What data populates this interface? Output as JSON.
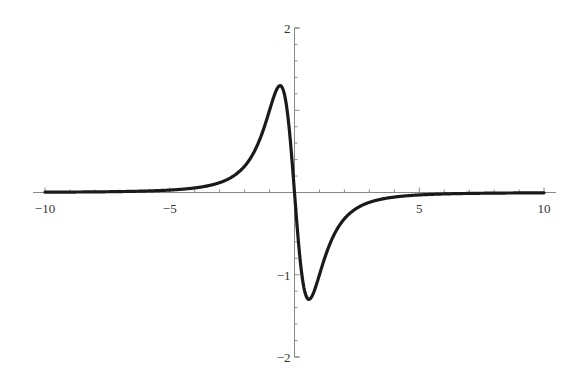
{
  "chart_data": {
    "type": "line",
    "title": "",
    "xlabel": "",
    "ylabel": "",
    "xlim": [
      -10,
      10
    ],
    "ylim": [
      -2,
      2
    ],
    "grid": false,
    "legend": null,
    "x_ticks": [
      -10,
      -5,
      5,
      10
    ],
    "x_tick_labels": [
      "−10",
      "−5",
      "5",
      "10"
    ],
    "y_ticks": [
      -2,
      -1,
      2
    ],
    "y_tick_labels": [
      "−2",
      "−1",
      "2"
    ],
    "series": [
      {
        "name": "f(x)",
        "color": "#1a1a1a",
        "x": [
          -10,
          -8,
          -6,
          -5,
          -4,
          -3,
          -2,
          -1.5,
          -1,
          -0.8,
          -0.577,
          -0.4,
          -0.2,
          0,
          0.2,
          0.4,
          0.577,
          0.8,
          1,
          1.5,
          2,
          3,
          4,
          5,
          6,
          8,
          10
        ],
        "y": [
          0.004,
          0.007,
          0.017,
          0.03,
          0.06,
          0.12,
          0.32,
          0.57,
          1.0,
          1.2,
          1.3,
          1.1,
          0.74,
          0,
          -0.74,
          -1.1,
          -1.3,
          -1.2,
          -1.0,
          -0.57,
          -0.32,
          -0.12,
          -0.06,
          -0.03,
          -0.017,
          -0.007,
          -0.004
        ]
      }
    ],
    "annotations": []
  },
  "axes": {
    "color": "#888888",
    "curve_color": "#1a1a1a"
  }
}
